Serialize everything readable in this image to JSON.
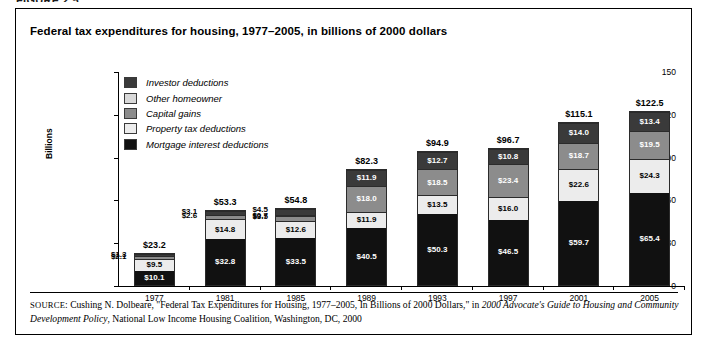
{
  "figure": {
    "heading": "FIGURE 2.5",
    "title": "Federal tax expenditures for housing, 1977–2005, in billions of 2000 dollars"
  },
  "legend": {
    "items": [
      {
        "label": "Investor deductions",
        "color": "#3a3a3a"
      },
      {
        "label": "Other homeowner",
        "color": "#d9d9d9"
      },
      {
        "label": "Capital gains",
        "color": "#8c8c8c"
      },
      {
        "label": "Property tax deductions",
        "color": "#ececec"
      },
      {
        "label": "Mortgage interest deductions",
        "color": "#111111"
      }
    ]
  },
  "source": {
    "prefix": "SOURCE",
    "text_1": ": Cushing N. Dolbeare, \"Federal Tax Expenditures for Housing, 1977–2005, In Billions of 2000 Dollars,\" in ",
    "italic_1": "2000 Advocate's Guide to Housing and Community Development Policy",
    "text_2": ", National Low Income Housing Coalition, Washington, DC, 2000"
  },
  "chart_data": {
    "type": "bar",
    "subtype": "stacked",
    "title": "Federal tax expenditures for housing, 1977–2005, in billions of 2000 dollars",
    "xlabel": "",
    "ylabel": "Billions",
    "ylim": [
      0,
      150
    ],
    "yticks": [
      0,
      30,
      60,
      90,
      120,
      150
    ],
    "ytick_labels": [
      "0",
      "30",
      "60",
      "90",
      "120",
      "150"
    ],
    "grid": false,
    "legend_position": "inside-top-left",
    "categories": [
      "1977",
      "1981",
      "1985",
      "1989",
      "1993",
      "1997",
      "2001",
      "2005"
    ],
    "series": [
      {
        "name": "Mortgage interest deductions",
        "color": "#111111",
        "values": [
          10.1,
          32.8,
          33.5,
          40.5,
          50.3,
          46.5,
          59.7,
          65.4
        ],
        "labels": [
          "$10.1",
          "$32.8",
          "$33.5",
          "$40.5",
          "$50.3",
          "$46.5",
          "$59.7",
          "$65.4"
        ]
      },
      {
        "name": "Property tax deductions",
        "color": "#ececec",
        "values": [
          9.5,
          14.8,
          12.6,
          11.9,
          13.5,
          16.0,
          22.6,
          24.3
        ],
        "labels": [
          "$9.5",
          "$14.8",
          "$12.6",
          "$11.9",
          "$13.5",
          "$16.0",
          "$22.6",
          "$24.3"
        ]
      },
      {
        "name": "Capital gains",
        "color": "#8c8c8c",
        "values": [
          2.1,
          2.6,
          3.5,
          18.0,
          18.5,
          23.4,
          18.7,
          19.5
        ],
        "labels": [
          "$2.1",
          "$2.6",
          "$3.5",
          "$18.0",
          "$18.5",
          "$23.4",
          "$18.7",
          "$19.5"
        ]
      },
      {
        "name": "Other homeowner",
        "color": "#d9d9d9",
        "values": [
          0.0,
          0.0,
          0.7,
          0.0,
          0.0,
          0.0,
          0.0,
          0.0
        ],
        "labels": [
          "",
          "",
          "$0.7",
          "",
          "",
          "",
          "",
          ""
        ]
      },
      {
        "name": "Investor deductions",
        "color": "#3a3a3a",
        "values": [
          1.3,
          3.1,
          4.5,
          11.9,
          12.7,
          10.8,
          14.0,
          13.4
        ],
        "labels": [
          "$1.3",
          "$3.1",
          "$4.5",
          "$11.9",
          "$12.7",
          "$10.8",
          "$14.0",
          "$13.4"
        ]
      }
    ],
    "totals": [
      23.2,
      53.3,
      54.8,
      82.3,
      94.9,
      96.7,
      115.1,
      122.5
    ],
    "total_labels": [
      "$23.2",
      "$53.3",
      "$54.8",
      "$82.3",
      "$94.9",
      "$96.7",
      "$115.1",
      "$122.5"
    ]
  }
}
